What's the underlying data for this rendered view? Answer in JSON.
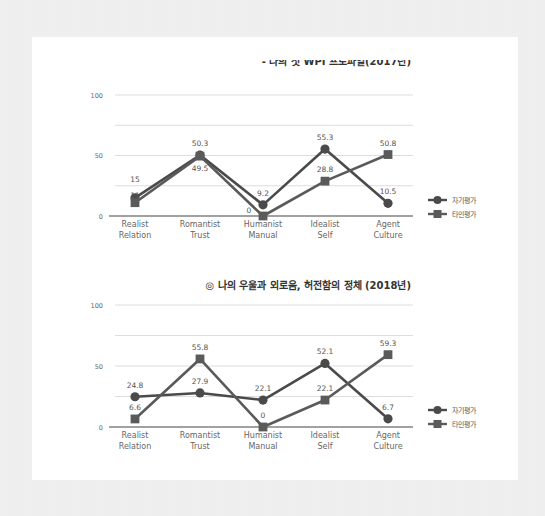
{
  "colors": {
    "series_self": "#4a4a4a",
    "series_other": "#5a5a5a",
    "grid": "#dddddd",
    "axis": "#444444",
    "panel": "#ffffff"
  },
  "chart_data": [
    {
      "type": "line",
      "title_lines": [
        "◎ ‘로맨인 줄 알았는데, 엠자(M) 였어!’",
        "- 나의 첫 WPI 프로파일(2017년)"
      ],
      "categories": [
        [
          "Realist",
          "Relation"
        ],
        [
          "Romantist",
          "Trust"
        ],
        [
          "Humanist",
          "Manual"
        ],
        [
          "Idealist",
          "Self"
        ],
        [
          "Agent",
          "Culture"
        ]
      ],
      "yticks": [
        "0",
        "50",
        "100"
      ],
      "ylim": [
        0,
        100
      ],
      "grid_values": [
        0,
        25,
        50,
        75,
        100
      ],
      "grid": true,
      "legend_position": "right",
      "series": [
        {
          "name": "자기평가",
          "marker": "circle",
          "values": [
            15,
            50.3,
            9.2,
            55.3,
            10.5
          ],
          "labels": [
            "15",
            "50.3",
            "9.2",
            "55.3",
            "10.5"
          ],
          "label_pos": [
            "above",
            "above",
            "above",
            "above",
            "above"
          ]
        },
        {
          "name": "타인평가",
          "marker": "square",
          "values": [
            11,
            49.5,
            0,
            28.8,
            50.8
          ],
          "labels": [
            "11",
            "49.5",
            "0",
            "28.8",
            "50.8"
          ],
          "label_pos": [
            "above2",
            "below",
            "left",
            "above",
            "above"
          ]
        }
      ]
    },
    {
      "type": "line",
      "title_lines": [
        "◎ 나의 우울과 외로움, 허전함의 정체 (2018년)"
      ],
      "categories": [
        [
          "Realist",
          "Relation"
        ],
        [
          "Romantist",
          "Trust"
        ],
        [
          "Humanist",
          "Manual"
        ],
        [
          "Idealist",
          "Self"
        ],
        [
          "Agent",
          "Culture"
        ]
      ],
      "yticks": [
        "0",
        "50",
        "100"
      ],
      "ylim": [
        0,
        100
      ],
      "grid_values": [
        0,
        25,
        50,
        75,
        100
      ],
      "grid": true,
      "legend_position": "right",
      "series": [
        {
          "name": "자기평가",
          "marker": "circle",
          "values": [
            24.8,
            27.9,
            22.1,
            52.1,
            6.7
          ],
          "labels": [
            "24.8",
            "27.9",
            "22.1",
            "52.1",
            "6.7"
          ],
          "label_pos": [
            "above",
            "above",
            "above",
            "above",
            "above"
          ]
        },
        {
          "name": "타인평가",
          "marker": "square",
          "values": [
            6.6,
            55.8,
            0,
            22.1,
            59.3
          ],
          "labels": [
            "6.6",
            "55.8",
            "0",
            "22.1",
            "59.3"
          ],
          "label_pos": [
            "above",
            "above",
            "above",
            "above",
            "above"
          ]
        }
      ]
    }
  ]
}
